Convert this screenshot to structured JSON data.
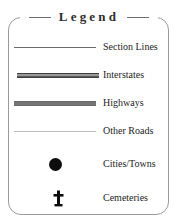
{
  "legend": {
    "title": "Legend",
    "colors": {
      "border": "#9a9a9a",
      "title_text": "#2e2e2e",
      "label_text": "#1d1d1d",
      "section_lines": "#6b6b6b",
      "interstates_casing": "#3f3f3f",
      "interstates_core": "#d8d8d8",
      "highways": "#757575",
      "other_roads": "#bdbdbd",
      "cities_towns": "#0d0d0d",
      "cemeteries": "#0d0d0d",
      "background": "#ffffff"
    },
    "entries": [
      {
        "label": "Section Lines",
        "symbol": "thin-line",
        "symbol_name": "section-line-swatch"
      },
      {
        "label": "Interstates",
        "symbol": "thick-cased-line",
        "symbol_name": "interstate-line-swatch"
      },
      {
        "label": "Highways",
        "symbol": "thick-solid-line",
        "symbol_name": "highway-line-swatch"
      },
      {
        "label": "Other Roads",
        "symbol": "hairline",
        "symbol_name": "other-road-line-swatch"
      },
      {
        "label": "Cities/Towns",
        "symbol": "filled-circle",
        "symbol_name": "city-dot-icon"
      },
      {
        "label": "Cemeteries",
        "symbol": "cross",
        "symbol_name": "cemetery-cross-icon"
      }
    ]
  }
}
